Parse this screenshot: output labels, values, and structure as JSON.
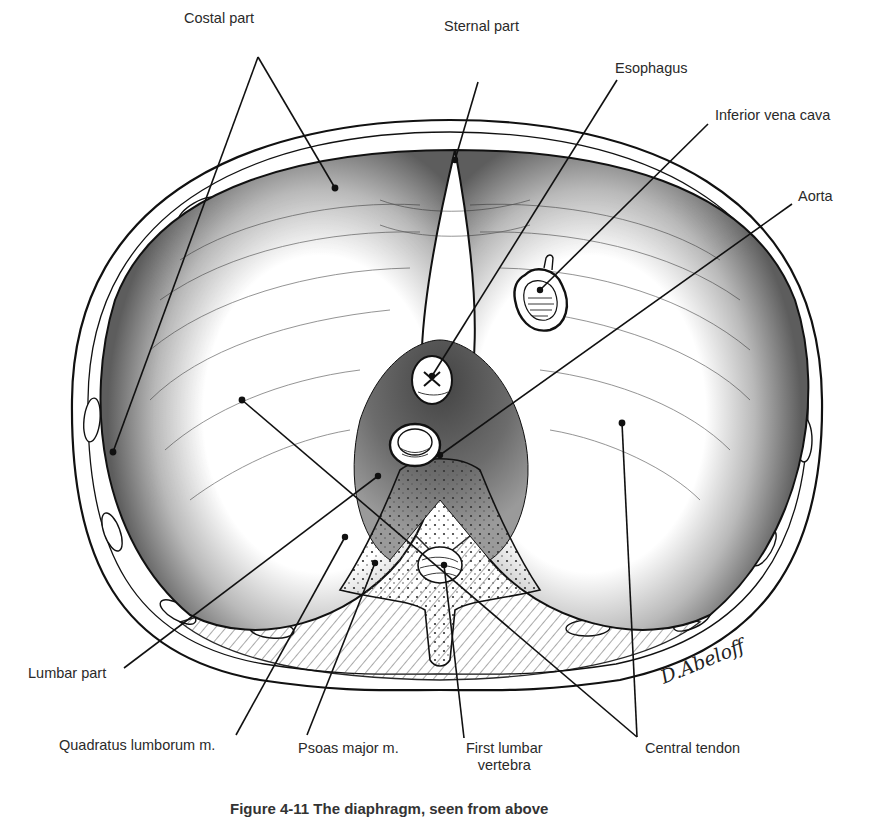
{
  "figure": {
    "type": "anatomical-illustration",
    "caption": "Figure 4-11 The diaphragm, seen from above",
    "signature": "D.Abeloff",
    "colors": {
      "ink": "#111111",
      "muscle_shade": "#7a7a7a",
      "tendon": "#ffffff",
      "background": "#ffffff"
    }
  },
  "labels": {
    "costal_part": "Costal part",
    "sternal_part": "Sternal part",
    "esophagus": "Esophagus",
    "inferior_vena_cava": "Inferior vena cava",
    "aorta": "Aorta",
    "lumbar_part": "Lumbar part",
    "quadratus_lumborum": "Quadratus lumborum m.",
    "psoas_major": "Psoas major m.",
    "first_lumbar_vertebra_line1": "First lumbar",
    "first_lumbar_vertebra_line2": "vertebra",
    "central_tendon": "Central tendon"
  }
}
